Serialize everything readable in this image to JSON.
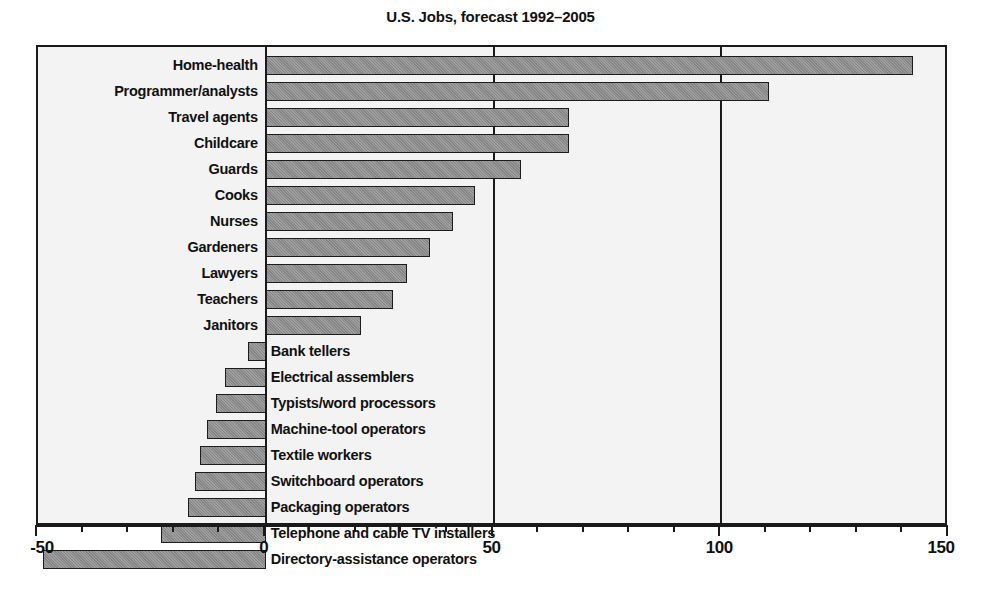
{
  "chart_data": {
    "type": "bar",
    "orientation": "horizontal",
    "title": "U.S. Jobs, forecast 1992–2005",
    "xlabel": "",
    "ylabel": "",
    "xlim": [
      -50,
      150
    ],
    "xticks": [
      -50,
      0,
      50,
      100,
      150
    ],
    "xtick_labels": [
      "-50",
      "0",
      "50",
      "100",
      "150"
    ],
    "minor_tick_step": 10,
    "grid": true,
    "gridlines_at": [
      0,
      50,
      100
    ],
    "legend": null,
    "bar_color": "#8c8c8c",
    "bar_edge_color": "#1c1c1c",
    "plot_background": "#f3f3f3",
    "frame_color": "#1a1a1a",
    "categories": [
      "Home-health",
      "Programmer/analysts",
      "Travel agents",
      "Childcare",
      "Guards",
      "Cooks",
      "Nurses",
      "Gardeners",
      "Lawyers",
      "Teachers",
      "Janitors",
      "Bank tellers",
      "Electrical assemblers",
      "Typists/word processors",
      "Machine-tool operators",
      "Textile workers",
      "Switchboard operators",
      "Packaging operators",
      "Telephone and cable TV installers",
      "Directory-assistance operators"
    ],
    "values": [
      142,
      110.5,
      66.5,
      66.5,
      56,
      46,
      41,
      36,
      31,
      28,
      21,
      -4,
      -9,
      -11,
      -13,
      -14.5,
      -15.5,
      -17,
      -23,
      -49
    ]
  },
  "bars": [
    {
      "label": "Home-health",
      "value": 142
    },
    {
      "label": "Programmer/analysts",
      "value": 110.5
    },
    {
      "label": "Travel agents",
      "value": 66.5
    },
    {
      "label": "Childcare",
      "value": 66.5
    },
    {
      "label": "Guards",
      "value": 56
    },
    {
      "label": "Cooks",
      "value": 46
    },
    {
      "label": "Nurses",
      "value": 41
    },
    {
      "label": "Gardeners",
      "value": 36
    },
    {
      "label": "Lawyers",
      "value": 31
    },
    {
      "label": "Teachers",
      "value": 28
    },
    {
      "label": "Janitors",
      "value": 21
    },
    {
      "label": "Bank tellers",
      "value": -4
    },
    {
      "label": "Electrical assemblers",
      "value": -9
    },
    {
      "label": "Typists/word processors",
      "value": -11
    },
    {
      "label": "Machine-tool operators",
      "value": -13
    },
    {
      "label": "Textile workers",
      "value": -14.5
    },
    {
      "label": "Switchboard operators",
      "value": -15.5
    },
    {
      "label": "Packaging operators",
      "value": -17
    },
    {
      "label": "Telephone and cable TV installers",
      "value": -23
    },
    {
      "label": "Directory-assistance operators",
      "value": -49
    }
  ]
}
